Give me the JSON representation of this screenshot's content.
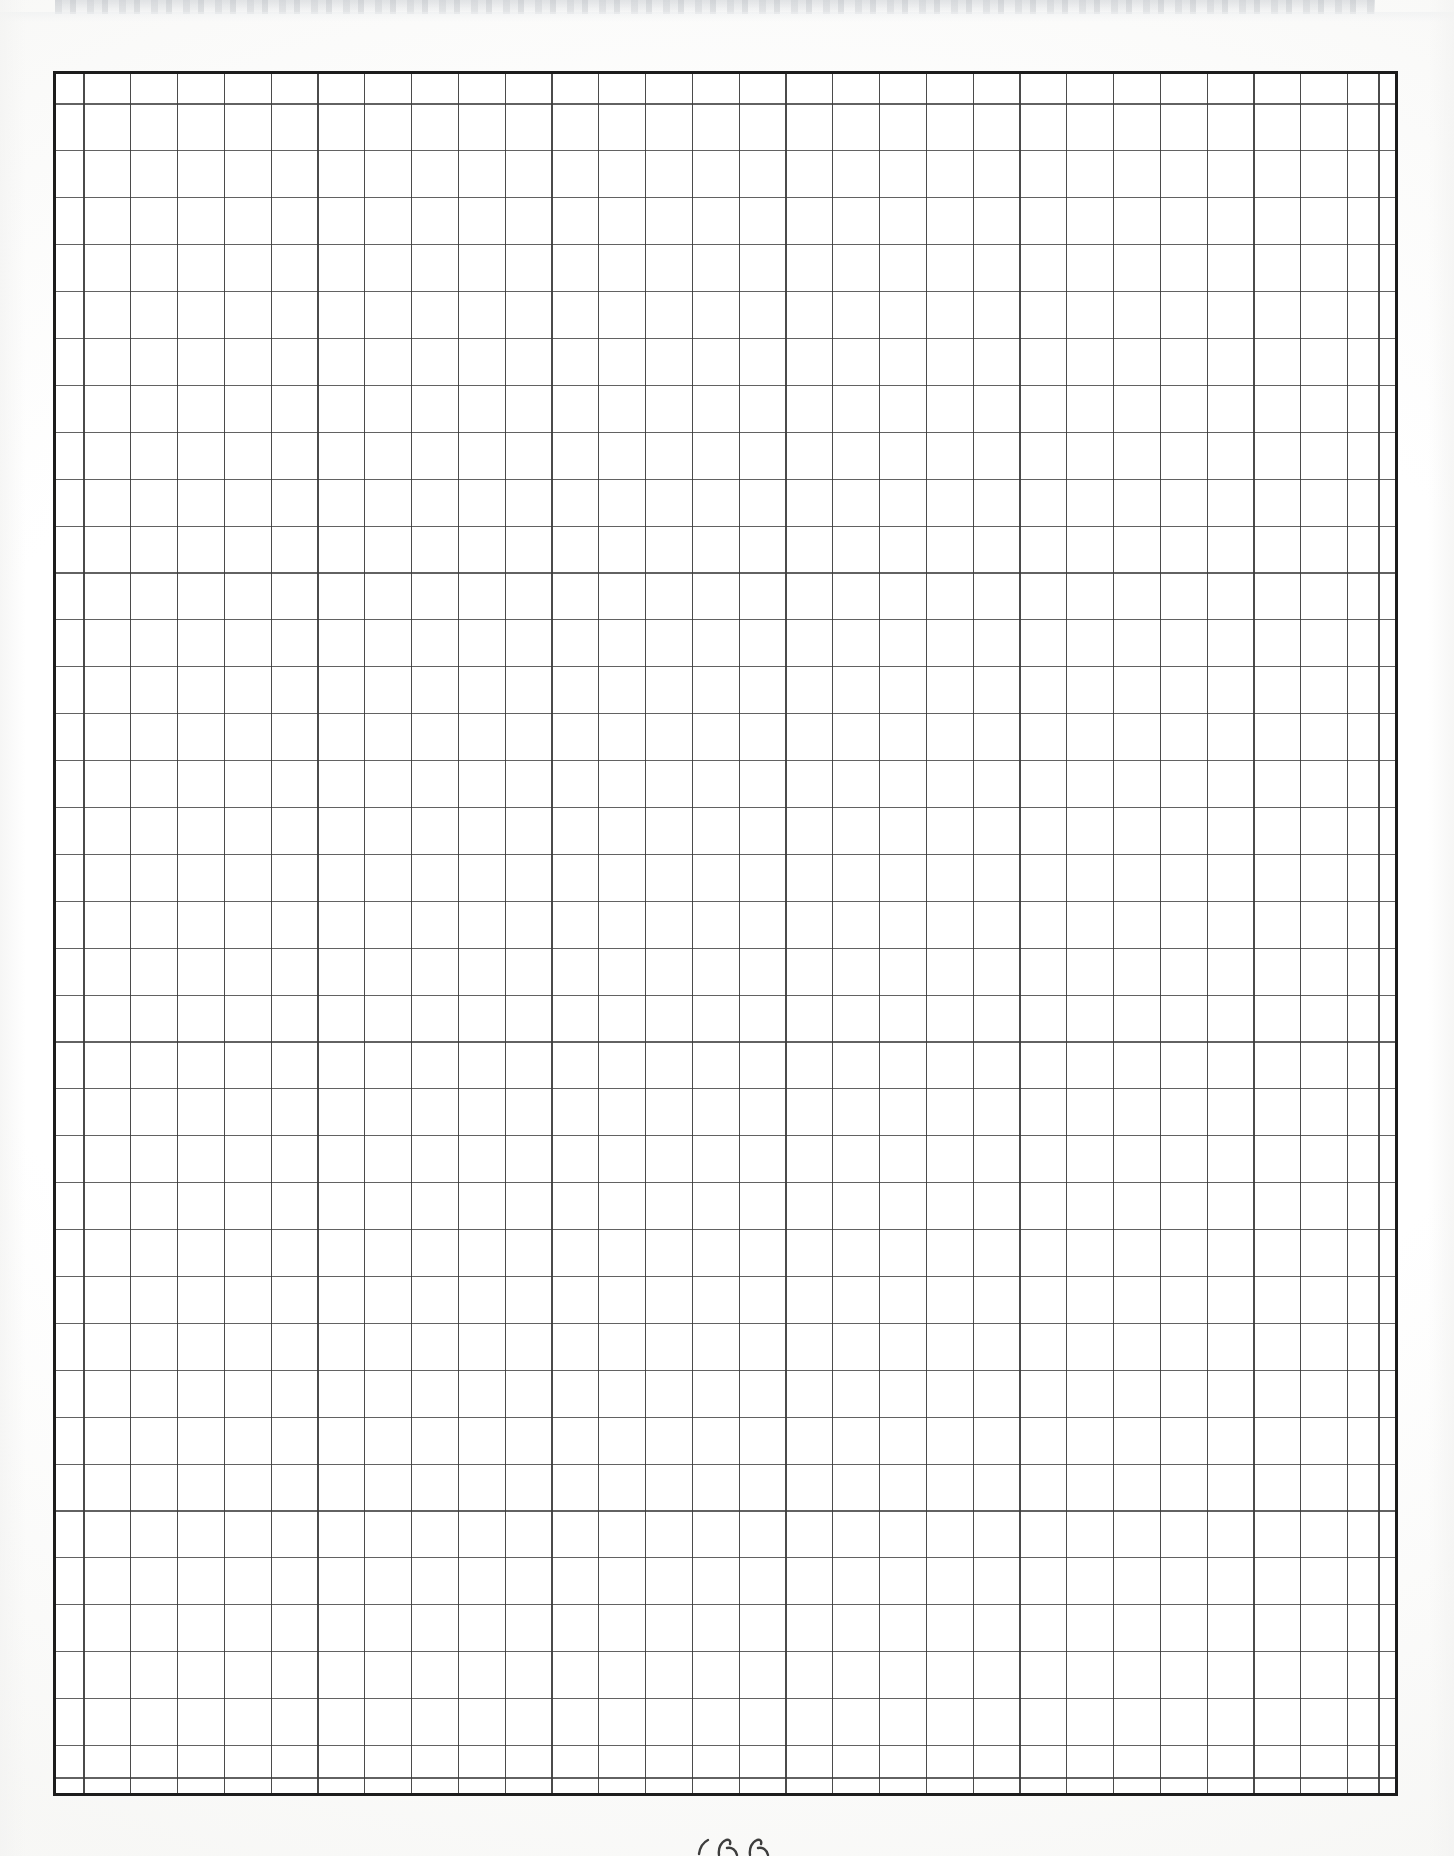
{
  "document": {
    "kind": "scanned-graph-paper",
    "page_width": 1454,
    "page_height": 1856,
    "background_color": "#ffffff",
    "has_visible_text": false,
    "text_content": ""
  },
  "scan_artifacts": {
    "top_band": {
      "label": "scanner edge band",
      "left": 55,
      "top": 0,
      "width": 1320,
      "height": 14,
      "color": "#c8cbcf"
    },
    "bottom_mark": {
      "label": "faint pencil mark",
      "left": 693,
      "top": 1836,
      "width": 86,
      "height": 20,
      "color": "#2b2b2b",
      "transcription": ""
    }
  },
  "grid": {
    "label": "graph paper grid",
    "left": 53,
    "top": 71,
    "width": 1345,
    "height": 1725,
    "border_color": "#1c1c1c",
    "border_width": 3,
    "rule_color": "#3c3c3c",
    "rule_width": 1.3,
    "columns": {
      "total": 30,
      "first_column_width": 28,
      "last_column_width": 16,
      "regular_column_width": 46.8,
      "regular_column_count": 28
    },
    "rows": {
      "total": 38,
      "first_row_height": 30,
      "last_row_height": 15,
      "regular_row_height": 46.9,
      "regular_row_count": 36
    }
  }
}
